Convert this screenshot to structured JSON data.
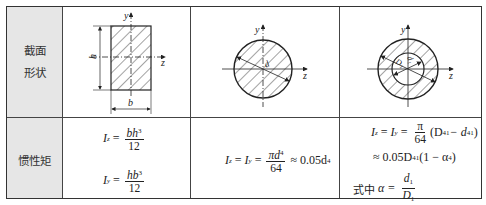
{
  "table": {
    "row_headers": [
      {
        "line1": "截面",
        "line2": "形状"
      },
      {
        "label": "惯性矩"
      }
    ],
    "shapes": [
      {
        "name": "rectangle",
        "axis_y": "y",
        "axis_z": "z",
        "height_label": "h",
        "width_label": "b"
      },
      {
        "name": "solid-circle",
        "axis_y": "y",
        "axis_z": "z",
        "diameter_label": "d"
      },
      {
        "name": "hollow-circle",
        "axis_y": "y",
        "axis_z": "z",
        "outer_label": "D₁",
        "inner_label": "d₁"
      }
    ],
    "formulas": {
      "rect": {
        "iz_lhs": "I",
        "iz_sub": "z",
        "iz_num_a": "bh",
        "iz_num_exp": "3",
        "iz_den": "12",
        "iy_lhs": "I",
        "iy_sub": "y",
        "iy_num_a": "hb",
        "iy_num_exp": "3",
        "iy_den": "12"
      },
      "circle": {
        "lhs1": "I",
        "sub1": "z",
        "lhs2": "I",
        "sub2": "y",
        "num": "πd",
        "num_exp": "4",
        "den": "64",
        "approx": "≈ 0.05d",
        "approx_exp": "4"
      },
      "hollow": {
        "line1_lhs1": "I",
        "line1_sub1": "z",
        "line1_lhs2": "I",
        "line1_sub2": "y",
        "line1_num": "π",
        "line1_den": "64",
        "line1_rest": "(D",
        "line1_rest_sub": "1",
        "line1_rest_exp": "4",
        "line1_minus": " − d",
        "line1_minus_sub": "1",
        "line1_minus_exp": "4",
        "line1_close": ")",
        "line2_prefix": "≈ 0.05D",
        "line2_sub": "1",
        "line2_exp": "4",
        "line2_rest": "(1 − α",
        "line2_rest_exp": "4",
        "line2_close": ")",
        "line3_prefix": "式中",
        "line3_alpha": "α =",
        "line3_num": "d",
        "line3_num_sub": "1",
        "line3_den": "D",
        "line3_den_sub": "1"
      }
    }
  }
}
